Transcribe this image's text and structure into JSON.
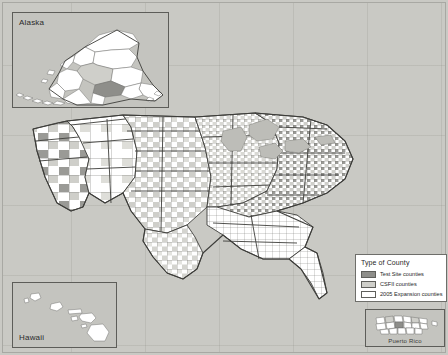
{
  "figure": {
    "type": "choropleth-map"
  },
  "insets": {
    "alaska": {
      "label": "Alaska"
    },
    "hawaii": {
      "label": "Hawaii"
    },
    "puerto_rico": {
      "label": "Puerto Rico"
    }
  },
  "legend": {
    "title": "Type of County",
    "items": [
      {
        "label": "Test Site counties",
        "color": "#8e8e8a",
        "key": "test-site"
      },
      {
        "label": "CSFII counties",
        "color": "#cfcfca",
        "key": "csfii"
      },
      {
        "label": "2005 Expansion counties",
        "color": "#ffffff",
        "key": "expansion-2005"
      }
    ]
  },
  "colors": {
    "background": "#c9c9c4",
    "inset_fill": "#c4c4bf",
    "county_stroke": "#6a6a66",
    "state_stroke": "#3d3d3a",
    "legend_border": "#6e6e6a",
    "lake": "#bdbdb8"
  },
  "map_areas": [
    {
      "name": "contiguous-united-states"
    },
    {
      "name": "alaska"
    },
    {
      "name": "hawaii"
    },
    {
      "name": "puerto-rico"
    }
  ]
}
